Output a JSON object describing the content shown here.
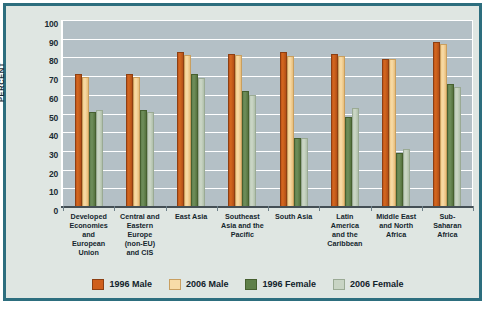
{
  "chart_data": {
    "type": "bar",
    "title": "",
    "xlabel": "",
    "ylabel": "PERCENT",
    "ylim": [
      0,
      100
    ],
    "yticks": [
      0,
      10,
      20,
      30,
      40,
      50,
      60,
      70,
      80,
      90,
      100
    ],
    "grid": true,
    "legend_position": "bottom",
    "categories": [
      "Developed Economies and European Union",
      "Central and Eastern Europe (non-EU) and CIS",
      "East Asia",
      "Southeast Asia and the Pacific",
      "South Asia",
      "Latin America and the Caribbean",
      "Middle East and North Africa",
      "Sub-Saharan Africa"
    ],
    "category_lines": [
      [
        "Developed",
        "Economies",
        "and",
        "European",
        "Union"
      ],
      [
        "Central and",
        "Eastern",
        "Europe",
        "(non-EU)",
        "and CIS"
      ],
      [
        "East Asia"
      ],
      [
        "Southeast",
        "Asia and the",
        "Pacific"
      ],
      [
        "South Asia"
      ],
      [
        "Latin",
        "America",
        "and the",
        "Caribbean"
      ],
      [
        "Middle East",
        "and North",
        "Africa"
      ],
      [
        "Sub-",
        "Saharan",
        "Africa"
      ]
    ],
    "series": [
      {
        "name": "1996 Male",
        "color": "#cf5f1c",
        "values": [
          71,
          71,
          83,
          82,
          83,
          82,
          79,
          88
        ]
      },
      {
        "name": "2006 Male",
        "color": "#f8dca8",
        "values": [
          69.5,
          69.5,
          81.5,
          81.5,
          81,
          81,
          79,
          87
        ]
      },
      {
        "name": "1996 Female",
        "color": "#5f8049",
        "values": [
          51,
          52,
          71,
          62,
          37,
          48,
          29,
          66
        ]
      },
      {
        "name": "2006 Female",
        "color": "#c8d4c4",
        "values": [
          52,
          51,
          69,
          60,
          37,
          53,
          31,
          64
        ]
      }
    ]
  },
  "legend": {
    "items": [
      {
        "label": "1996 Male"
      },
      {
        "label": "2006 Male"
      },
      {
        "label": "1996 Female"
      },
      {
        "label": "2006 Female"
      }
    ]
  },
  "colors": {
    "frame_border": "#2d6e7e",
    "panel_background": "#dfe6e2",
    "plot_background": "#b4c0c6",
    "gridline": "#ffffff",
    "text": "#15262e"
  },
  "source": {
    "text": ""
  }
}
